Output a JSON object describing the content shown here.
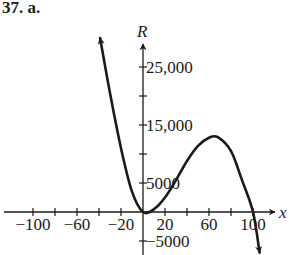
{
  "problem": {
    "label": "37. a."
  },
  "chart_data": {
    "type": "line",
    "title": "",
    "xlabel": "x",
    "ylabel": "R",
    "xlim": [
      -130,
      120
    ],
    "ylim": [
      -7000,
      29000
    ],
    "grid": false,
    "x_ticks": [
      -100,
      -80,
      -60,
      -40,
      -20,
      0,
      20,
      40,
      60,
      80,
      100
    ],
    "x_tick_labels": [
      {
        "value": -100,
        "text": "−100"
      },
      {
        "value": -60,
        "text": "−60"
      },
      {
        "value": -20,
        "text": "−20"
      },
      {
        "value": 20,
        "text": "20"
      },
      {
        "value": 60,
        "text": "60"
      },
      {
        "value": 100,
        "text": "100"
      }
    ],
    "y_ticks": [
      -5000,
      5000,
      10000,
      15000,
      20000,
      25000
    ],
    "y_tick_labels": [
      {
        "value": 25000,
        "text": "25,000"
      },
      {
        "value": 15000,
        "text": "15,000"
      },
      {
        "value": 5000,
        "text": "5000"
      },
      {
        "value": -5000,
        "text": "−5000"
      }
    ],
    "series": [
      {
        "name": "R(x)",
        "description": "Cubic-shaped curve with arrows at both ends; local minimum near (0, 0), local maximum near (68, 12900), crosses zero again near x = 100",
        "points": [
          {
            "x": -39,
            "y": 30000
          },
          {
            "x": -30,
            "y": 20500
          },
          {
            "x": -20,
            "y": 11000
          },
          {
            "x": -10,
            "y": 3500
          },
          {
            "x": 0,
            "y": 0
          },
          {
            "x": 10,
            "y": 500
          },
          {
            "x": 20,
            "y": 2500
          },
          {
            "x": 30,
            "y": 5500
          },
          {
            "x": 40,
            "y": 8800
          },
          {
            "x": 50,
            "y": 11400
          },
          {
            "x": 60,
            "y": 12800
          },
          {
            "x": 68,
            "y": 12900
          },
          {
            "x": 80,
            "y": 10500
          },
          {
            "x": 90,
            "y": 5500
          },
          {
            "x": 100,
            "y": 0
          },
          {
            "x": 106,
            "y": -7000
          }
        ]
      }
    ]
  }
}
